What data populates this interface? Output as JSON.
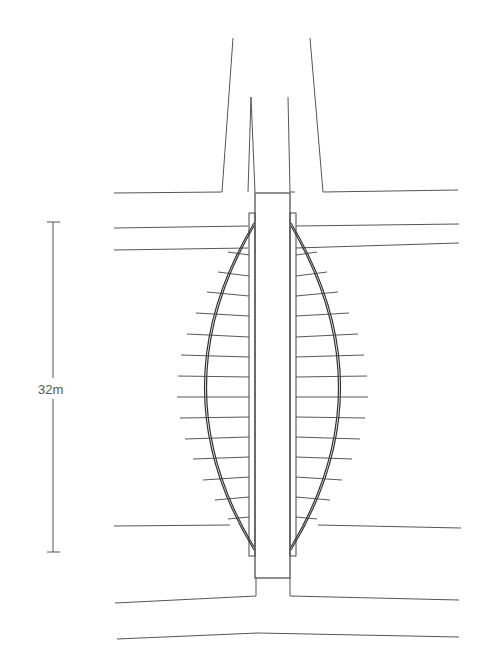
{
  "drawing": {
    "type": "architectural plan",
    "subject": "lenticular (fish-belly) pedestrian bridge over channel",
    "scale_bar": {
      "label": "32m",
      "y_top": 222,
      "y_bottom": 552,
      "x": 53
    },
    "colors": {
      "line": "#555555",
      "structure": "#333333",
      "background": "#ffffff"
    },
    "deck": {
      "x_left": 255,
      "x_right": 290,
      "y_top": 193,
      "y_bottom": 578
    },
    "rib_count_per_side": 18
  }
}
